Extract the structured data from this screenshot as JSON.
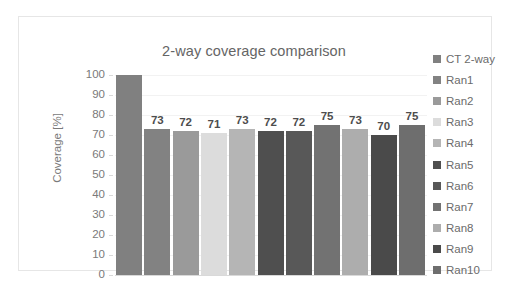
{
  "chart_data": {
    "type": "bar",
    "title": "2-way coverage comparison",
    "xlabel": "",
    "ylabel": "Coverage [%]",
    "ylim": [
      0,
      100
    ],
    "yticks": [
      100,
      90,
      80,
      70,
      60,
      50,
      40,
      30,
      20,
      10,
      0
    ],
    "grid": true,
    "legend_position": "right",
    "categories": [
      "CT 2-way",
      "Ran1",
      "Ran2",
      "Ran3",
      "Ran4",
      "Ran5",
      "Ran6",
      "Ran7",
      "Ran8",
      "Ran9",
      "Ran10"
    ],
    "values": [
      100,
      73,
      72,
      71,
      73,
      72,
      72,
      75,
      73,
      70,
      75
    ],
    "data_labels": [
      "",
      "73",
      "72",
      "71",
      "73",
      "72",
      "72",
      "75",
      "73",
      "70",
      "75"
    ],
    "colors": [
      "#808080",
      "#828282",
      "#9a9a9a",
      "#dcdcdc",
      "#b5b5b5",
      "#4f4f4f",
      "#585858",
      "#727272",
      "#adadad",
      "#4a4a4a",
      "#6e6e6e"
    ],
    "series": [
      {
        "name": "CT 2-way",
        "value": 100,
        "label": "",
        "color": "#808080"
      },
      {
        "name": "Ran1",
        "value": 73,
        "label": "73",
        "color": "#828282"
      },
      {
        "name": "Ran2",
        "value": 72,
        "label": "72",
        "color": "#9a9a9a"
      },
      {
        "name": "Ran3",
        "value": 71,
        "label": "71",
        "color": "#dcdcdc"
      },
      {
        "name": "Ran4",
        "value": 73,
        "label": "73",
        "color": "#b5b5b5"
      },
      {
        "name": "Ran5",
        "value": 72,
        "label": "72",
        "color": "#4f4f4f"
      },
      {
        "name": "Ran6",
        "value": 72,
        "label": "72",
        "color": "#585858"
      },
      {
        "name": "Ran7",
        "value": 75,
        "label": "75",
        "color": "#727272"
      },
      {
        "name": "Ran8",
        "value": 73,
        "label": "73",
        "color": "#adadad"
      },
      {
        "name": "Ran9",
        "value": 70,
        "label": "70",
        "color": "#4a4a4a"
      },
      {
        "name": "Ran10",
        "value": 75,
        "label": "75",
        "color": "#6e6e6e"
      }
    ]
  },
  "legend": {
    "items": [
      {
        "label": "CT 2-way",
        "color": "#808080"
      },
      {
        "label": "Ran1",
        "color": "#828282"
      },
      {
        "label": "Ran2",
        "color": "#9a9a9a"
      },
      {
        "label": "Ran3",
        "color": "#dcdcdc"
      },
      {
        "label": "Ran4",
        "color": "#b5b5b5"
      },
      {
        "label": "Ran5",
        "color": "#4f4f4f"
      },
      {
        "label": "Ran6",
        "color": "#585858"
      },
      {
        "label": "Ran7",
        "color": "#727272"
      },
      {
        "label": "Ran8",
        "color": "#adadad"
      },
      {
        "label": "Ran9",
        "color": "#4a4a4a"
      },
      {
        "label": "Ran10",
        "color": "#6e6e6e"
      }
    ]
  },
  "style": {
    "border_color": "#e6e6e6",
    "grid_color": "#f2f2f2",
    "axis_color": "#d9d9d9",
    "title_color": "#656565",
    "tick_color": "#7a7a7a",
    "label_color": "#4d4d4d"
  }
}
